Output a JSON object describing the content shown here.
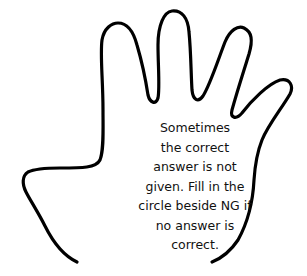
{
  "illustration": {
    "subject": "hand-outline",
    "stroke_color": "#000000",
    "background_color": "#ffffff"
  },
  "message": {
    "lines": [
      "Sometimes",
      "the correct",
      "answer is not",
      "given. Fill in the",
      "circle beside NG if",
      "no answer is",
      "correct."
    ],
    "full_text": "Sometimes the correct answer is not given. Fill in the circle beside NG if no answer is correct."
  }
}
